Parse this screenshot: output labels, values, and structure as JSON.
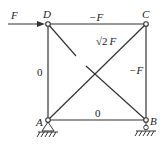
{
  "diagram": {
    "type": "truss",
    "nodes": {
      "D": {
        "label": "D"
      },
      "C": {
        "label": "C"
      },
      "A": {
        "label": "A"
      },
      "B": {
        "label": "B"
      }
    },
    "applied_load": {
      "label": "F",
      "at": "D",
      "direction": "right"
    },
    "members": [
      {
        "id": "DC",
        "force": "−F"
      },
      {
        "id": "CB",
        "force": "−F"
      },
      {
        "id": "DA",
        "force": "0"
      },
      {
        "id": "AB",
        "force": "0"
      },
      {
        "id": "AC",
        "force_radical": "√2",
        "force_symbol": "F"
      },
      {
        "id": "DB",
        "force": ""
      }
    ],
    "supports": {
      "A": "pin",
      "B": "roller"
    },
    "colors": {
      "line": "#333333"
    }
  }
}
